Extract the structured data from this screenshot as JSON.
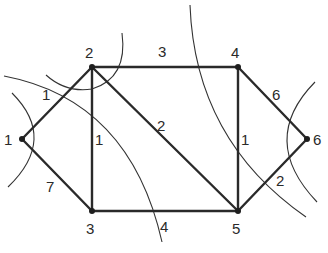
{
  "diagram": {
    "type": "weighted-undirected-graph",
    "nodes": [
      {
        "id": "1",
        "label": "1",
        "x": 22,
        "y": 139,
        "lx": 4,
        "ly": 145
      },
      {
        "id": "2",
        "label": "2",
        "x": 92,
        "y": 67,
        "lx": 85,
        "ly": 58
      },
      {
        "id": "3",
        "label": "3",
        "x": 92,
        "y": 211,
        "lx": 86,
        "ly": 234
      },
      {
        "id": "4",
        "label": "4",
        "x": 238,
        "y": 67,
        "lx": 231,
        "ly": 58
      },
      {
        "id": "5",
        "label": "5",
        "x": 238,
        "y": 211,
        "lx": 232,
        "ly": 234
      },
      {
        "id": "6",
        "label": "6",
        "x": 307,
        "y": 139,
        "lx": 313,
        "ly": 145
      }
    ],
    "edges": [
      {
        "from": "1",
        "to": "2",
        "weight": "1",
        "lx": 42,
        "ly": 100
      },
      {
        "from": "1",
        "to": "3",
        "weight": "7",
        "lx": 46,
        "ly": 192
      },
      {
        "from": "2",
        "to": "3",
        "weight": "1",
        "lx": 95,
        "ly": 145
      },
      {
        "from": "2",
        "to": "4",
        "weight": "3",
        "lx": 158,
        "ly": 57
      },
      {
        "from": "2",
        "to": "5",
        "weight": "2",
        "lx": 157,
        "ly": 131
      },
      {
        "from": "4",
        "to": "5",
        "weight": "1",
        "lx": 241,
        "ly": 145
      },
      {
        "from": "3",
        "to": "5",
        "weight": "4",
        "lx": 160,
        "ly": 232
      },
      {
        "from": "4",
        "to": "6",
        "weight": "6",
        "lx": 272,
        "ly": 100
      },
      {
        "from": "5",
        "to": "6",
        "weight": "2",
        "lx": 276,
        "ly": 186
      }
    ],
    "cuts": [
      {
        "name": "cut-around-node-1",
        "path": "M 12 93 Q 58 139 8 187"
      },
      {
        "name": "cut-around-node-2",
        "path": "M 122 33 Q 128 78 92 89 Q 66 93 46 75"
      },
      {
        "name": "cut-left-long",
        "path": "M 4 76 Q 130 100 162 242"
      },
      {
        "name": "cut-right-long",
        "path": "M 190 5 Q 195 140 306 217"
      },
      {
        "name": "cut-around-node-6",
        "path": "M 315 82 Q 258 140 317 202"
      }
    ]
  }
}
